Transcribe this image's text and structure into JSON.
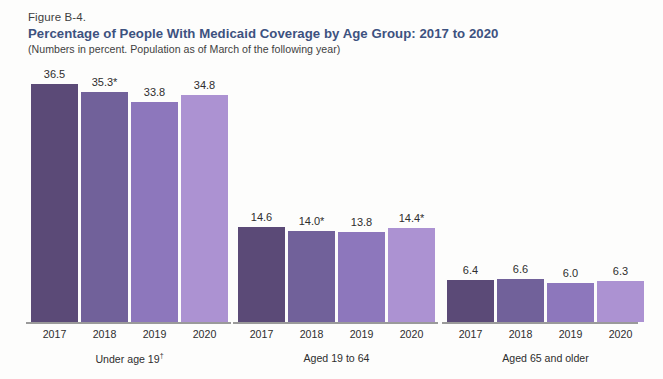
{
  "figure": {
    "number": "Figure B-4.",
    "title": "Percentage of People With Medicaid Coverage by Age Group: 2017 to 2020",
    "subtitle": "(Numbers in percent. Population as of March of the following year)",
    "title_color": "#3d5280",
    "text_color": "#2e2e2e"
  },
  "chart_data": {
    "type": "bar",
    "title": "Percentage of People With Medicaid Coverage by Age Group: 2017 to 2020",
    "subtitle": "(Numbers in percent. Population as of March of the following year)",
    "xlabel": "",
    "ylabel": "",
    "ylim": [
      0,
      40
    ],
    "grid": false,
    "legend": "none",
    "categories": [
      "2017",
      "2018",
      "2019",
      "2020"
    ],
    "groups": [
      {
        "name": "Under age 19",
        "footnote_marker": "†",
        "label_display": "Under age 19",
        "values": [
          36.5,
          35.3,
          33.8,
          34.8
        ],
        "value_labels": [
          "36.5",
          "35.3*",
          "33.8",
          "34.8"
        ]
      },
      {
        "name": "Aged 19 to 64",
        "footnote_marker": "",
        "label_display": "Aged 19 to 64",
        "values": [
          14.6,
          14.0,
          13.8,
          14.4
        ],
        "value_labels": [
          "14.6",
          "14.0*",
          "13.8",
          "14.4*"
        ]
      },
      {
        "name": "Aged 65 and older",
        "footnote_marker": "",
        "label_display": "Aged 65 and older",
        "values": [
          6.4,
          6.6,
          6.0,
          6.3
        ],
        "value_labels": [
          "6.4",
          "6.6",
          "6.0",
          "6.3"
        ]
      }
    ],
    "series_colors": [
      "#5b4a77",
      "#71619a",
      "#8d77bc",
      "#ac92d2"
    ],
    "annotations": [
      "* Statistically different from the previous year."
    ]
  }
}
